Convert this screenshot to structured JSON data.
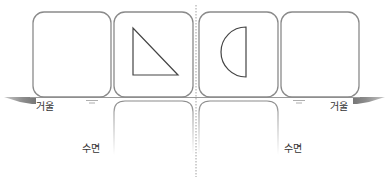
{
  "diagram": {
    "labels": {
      "mirror_left": "거울",
      "mirror_right": "거울",
      "water_left": "수면",
      "water_right": "수면"
    },
    "cards": [
      {
        "id": 1,
        "shape": "empty"
      },
      {
        "id": 2,
        "shape": "right-triangle"
      },
      {
        "id": 3,
        "shape": "half-circle"
      },
      {
        "id": 4,
        "shape": "empty"
      }
    ],
    "colors": {
      "card_border": "#8a8a8a",
      "shape_stroke": "#444444",
      "shadow": "#9a9a9a",
      "axis_line": "#9a9a9a"
    }
  }
}
